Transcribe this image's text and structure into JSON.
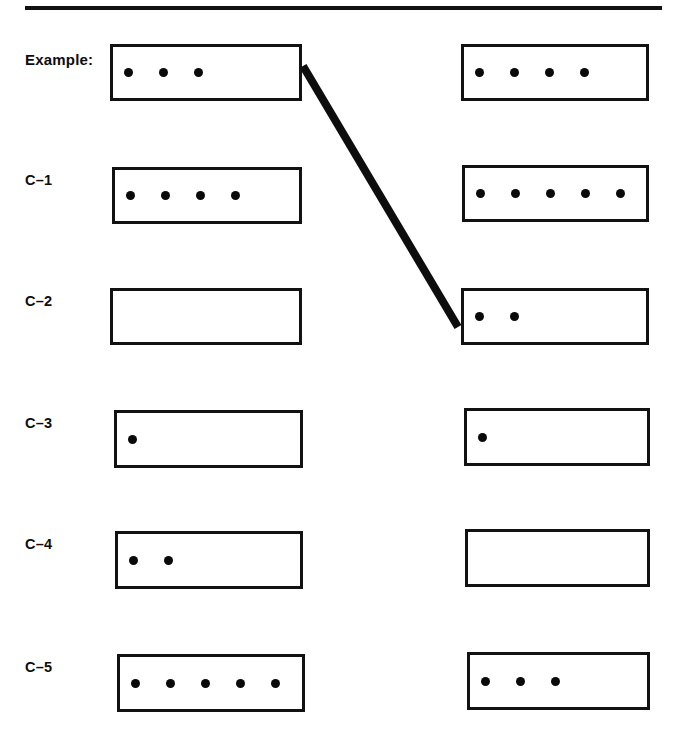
{
  "worksheet": {
    "title_rule": "horizontal-rule",
    "ink_color": "#111111",
    "background_color": "#ffffff",
    "rows": [
      {
        "label": "Example:",
        "label_bold": true,
        "left_dots": 3,
        "right_dots": 4,
        "left_box": {
          "x": 110,
          "y": 44,
          "w": 192,
          "h": 57
        },
        "right_box": {
          "x": 461,
          "y": 44,
          "w": 188,
          "h": 57
        },
        "connected": true
      },
      {
        "label": "C–1",
        "label_bold": true,
        "left_dots": 4,
        "right_dots": 5,
        "left_box": {
          "x": 112,
          "y": 167,
          "w": 190,
          "h": 57
        },
        "right_box": {
          "x": 462,
          "y": 165,
          "w": 187,
          "h": 57
        },
        "connected": false
      },
      {
        "label": "C–2",
        "label_bold": true,
        "left_dots": 0,
        "right_dots": 2,
        "left_box": {
          "x": 110,
          "y": 288,
          "w": 192,
          "h": 57
        },
        "right_box": {
          "x": 461,
          "y": 288,
          "w": 188,
          "h": 57
        },
        "connected": false
      },
      {
        "label": "C–3",
        "label_bold": true,
        "left_dots": 1,
        "right_dots": 1,
        "left_box": {
          "x": 114,
          "y": 410,
          "w": 189,
          "h": 58
        },
        "right_box": {
          "x": 464,
          "y": 408,
          "w": 186,
          "h": 58
        },
        "connected": false
      },
      {
        "label": "C–4",
        "label_bold": true,
        "left_dots": 2,
        "right_dots": 0,
        "left_box": {
          "x": 115,
          "y": 531,
          "w": 188,
          "h": 58
        },
        "right_box": {
          "x": 465,
          "y": 529,
          "w": 185,
          "h": 58
        },
        "connected": false
      },
      {
        "label": "C–5",
        "label_bold": true,
        "left_dots": 5,
        "right_dots": 3,
        "left_box": {
          "x": 117,
          "y": 654,
          "w": 188,
          "h": 58
        },
        "right_box": {
          "x": 467,
          "y": 652,
          "w": 183,
          "h": 58
        },
        "connected": false
      }
    ],
    "connector": {
      "from_x": 303,
      "from_y": 66,
      "to_x": 458,
      "to_y": 327,
      "stroke_width": 8,
      "color": "#0d0d0d"
    },
    "rule": {
      "x": 25,
      "y": 6,
      "width": 637,
      "height": 4
    }
  }
}
